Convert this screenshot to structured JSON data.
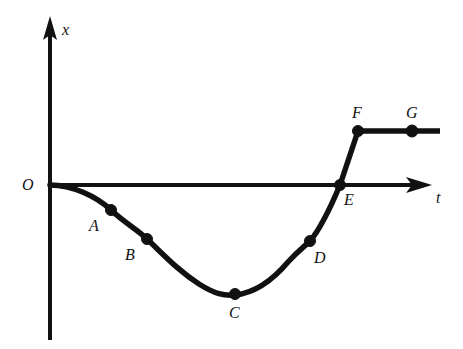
{
  "figure": {
    "background_color": "#ffffff",
    "ink_color": "#111111"
  },
  "axes": {
    "vertical": {
      "label": "x",
      "label_x": 62,
      "label_y": 22,
      "arrow": "up-arrow-icon"
    },
    "horizontal": {
      "label": "t",
      "label_x": 436,
      "label_y": 190,
      "arrow": "right-arrow-icon"
    },
    "origin": {
      "label": "O",
      "label_x": 22,
      "label_y": 177
    }
  },
  "points": [
    {
      "id": "A",
      "label": "A",
      "dot_x": 111,
      "dot_y": 210,
      "label_x": 89,
      "label_y": 218
    },
    {
      "id": "B",
      "label": "B",
      "dot_x": 147,
      "dot_y": 239,
      "label_x": 125,
      "label_y": 247
    },
    {
      "id": "C",
      "label": "C",
      "dot_x": 235,
      "dot_y": 294,
      "label_x": 229,
      "label_y": 305
    },
    {
      "id": "D",
      "label": "D",
      "dot_x": 310,
      "dot_y": 241,
      "label_x": 314,
      "label_y": 250
    },
    {
      "id": "E",
      "label": "E",
      "dot_x": 340,
      "dot_y": 185,
      "label_x": 344,
      "label_y": 192
    },
    {
      "id": "F",
      "label": "F",
      "dot_x": 358,
      "dot_y": 131,
      "label_x": 352,
      "label_y": 105
    },
    {
      "id": "G",
      "label": "G",
      "dot_x": 412,
      "dot_y": 131,
      "label_x": 406,
      "label_y": 105
    }
  ],
  "chart_data": {
    "type": "line",
    "title": "",
    "xlabel": "t",
    "ylabel": "x",
    "grid": false,
    "legend": null,
    "axis_origin_px": {
      "x": 50,
      "y": 185
    },
    "annotations": [
      "O",
      "A",
      "B",
      "C",
      "D",
      "E",
      "F",
      "G"
    ],
    "points_px": [
      {
        "name": "O",
        "x": 50,
        "y": 185
      },
      {
        "name": "A",
        "x": 111,
        "y": 210
      },
      {
        "name": "B",
        "x": 147,
        "y": 239
      },
      {
        "name": "C",
        "x": 235,
        "y": 294
      },
      {
        "name": "D",
        "x": 310,
        "y": 241
      },
      {
        "name": "E",
        "x": 340,
        "y": 185
      },
      {
        "name": "F",
        "x": 358,
        "y": 131
      },
      {
        "name": "G",
        "x": 412,
        "y": 131
      }
    ],
    "series": [
      {
        "name": "x(t)",
        "x": [
          0.0,
          1.1,
          1.8,
          3.4,
          4.7,
          5.2,
          5.6,
          6.6
        ],
        "values": [
          0.0,
          -0.46,
          -1.0,
          -2.0,
          -1.04,
          0.0,
          1.0,
          1.0
        ],
        "point_labels": [
          "O",
          "A",
          "B",
          "C",
          "D",
          "E",
          "F",
          "G"
        ]
      }
    ],
    "path_d": "M 50 185 C 72 185, 96 196, 111 210 C 126 224, 137 229, 147 239 C 166 257, 180 272, 199 284 C 215 294, 224 296, 235 295 C 254 293, 272 281, 288 262 C 299 250, 305 246, 310 241 C 322 227, 332 204, 340 185 L 358 131 L 440 131",
    "xlim_px": [
      50,
      440
    ],
    "ylim_px": [
      131,
      295
    ]
  }
}
